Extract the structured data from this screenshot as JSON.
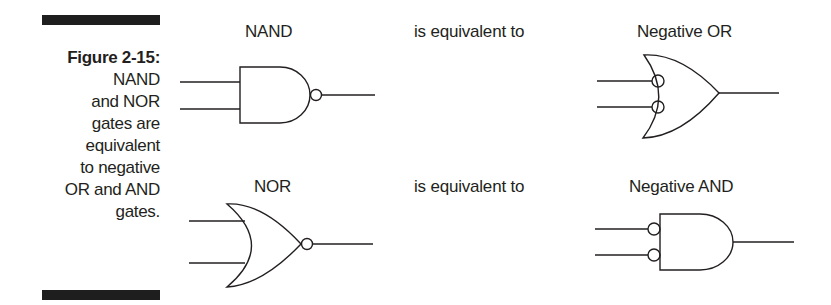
{
  "caption": {
    "title": "Figure 2-15:",
    "lines": [
      "NAND",
      "and NOR",
      "gates are",
      "equivalent",
      "to negative",
      "OR and AND",
      "gates."
    ]
  },
  "rows": [
    {
      "left_label": "NAND",
      "middle_text": "is equivalent to",
      "right_label": "Negative OR"
    },
    {
      "left_label": "NOR",
      "middle_text": "is equivalent to",
      "right_label": "Negative AND"
    }
  ],
  "colors": {
    "stroke": "#231f20",
    "bar": "#1e1e1e",
    "background": "#ffffff"
  }
}
